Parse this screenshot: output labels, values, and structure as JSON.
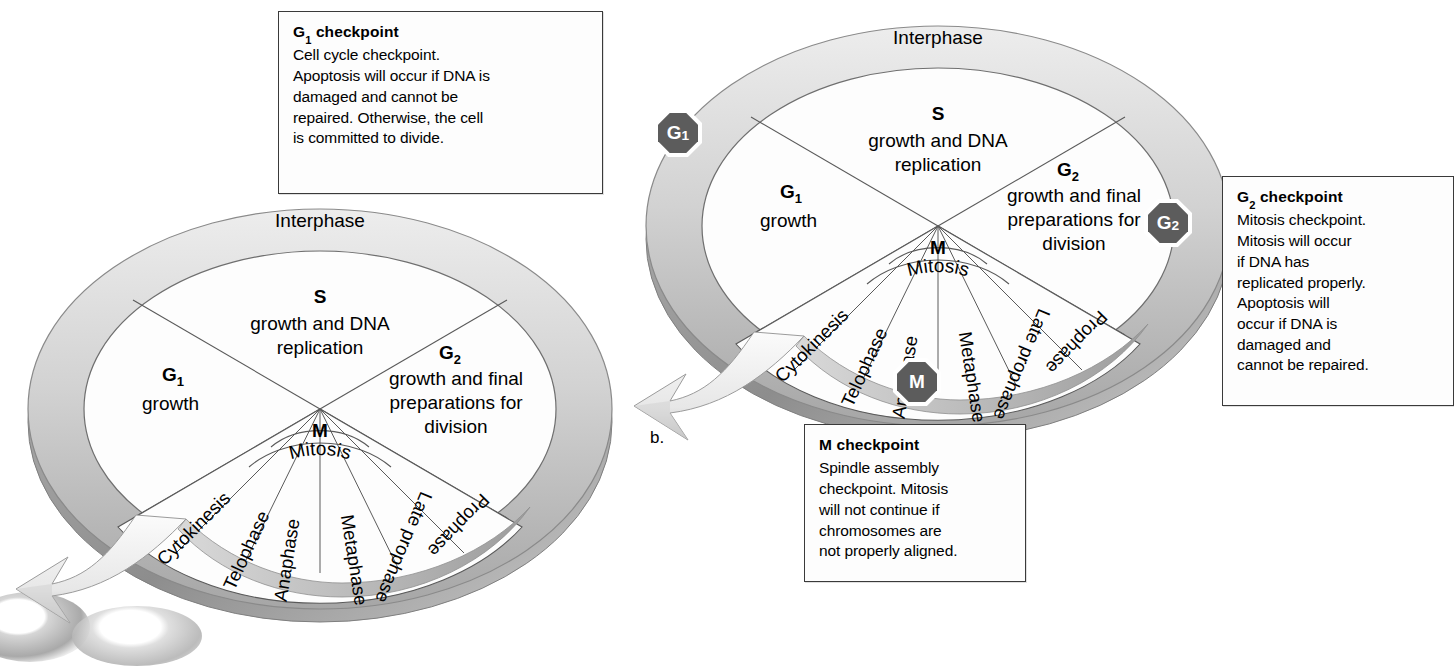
{
  "figure": {
    "part_label_b": "b."
  },
  "cycle": {
    "interphase_label": "Interphase",
    "quadrants": [
      {
        "key": "S",
        "title": "S",
        "sub": "S",
        "lines": [
          "growth and DNA",
          "replication"
        ]
      },
      {
        "key": "G2",
        "title": "G",
        "sub": "2",
        "lines": [
          "growth and final",
          "preparations for",
          "division"
        ]
      },
      {
        "key": "G1",
        "title": "G",
        "sub": "1",
        "lines": [
          "growth"
        ]
      }
    ],
    "mitosis": {
      "letter": "M",
      "label": "Mitosis",
      "phases": [
        "Cytokinesis",
        "Telophase",
        "Anaphase",
        "Metaphase",
        "Late prophase",
        "Prophase"
      ]
    }
  },
  "badges": [
    {
      "name": "G1-checkpoint-badge",
      "letter": "G",
      "sub": "1"
    },
    {
      "name": "G2-checkpoint-badge",
      "letter": "G",
      "sub": "2"
    },
    {
      "name": "M-checkpoint-badge",
      "letter": "M",
      "sub": ""
    }
  ],
  "callouts": {
    "g1": {
      "title_main": "G",
      "title_sub": "1",
      "title_rest": " checkpoint",
      "lines": [
        "Cell cycle checkpoint.",
        "Apoptosis will occur if DNA is",
        "damaged and cannot be",
        "repaired. Otherwise, the cell",
        "is committed to divide."
      ]
    },
    "g2": {
      "title_main": "G",
      "title_sub": "2",
      "title_rest": " checkpoint",
      "lines": [
        "Mitosis checkpoint.",
        "Mitosis will occur",
        "if DNA has",
        "replicated properly.",
        "Apoptosis will",
        "occur if DNA is",
        "damaged and",
        "cannot be repaired."
      ]
    },
    "m": {
      "title_main": "M",
      "title_sub": "",
      "title_rest": " checkpoint",
      "lines": [
        "Spindle assembly",
        "checkpoint. Mitosis",
        "will not continue if",
        "chromosomes are",
        "not properly aligned."
      ]
    }
  },
  "colors": {
    "ring_light": "#e0e0e0",
    "ring_mid": "#c2c2c2",
    "ring_dark": "#8f8f8f",
    "badge_fill": "#5c5c5c",
    "outline": "#4a4a4a",
    "box_border": "#3a3a3a"
  }
}
